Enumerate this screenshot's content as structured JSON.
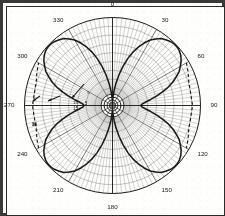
{
  "figure": {
    "frame_color": "#3a3a38",
    "background_color": "#fefefc",
    "ink_color": "#1a1a1a",
    "grid_color": "#5a5a58"
  },
  "chart_data": {
    "type": "line",
    "projection": "polar",
    "title": "",
    "xlabel": "",
    "ylabel": "",
    "angle_unit": "degrees",
    "angle_direction": "clockwise",
    "angle_zero_location": "N",
    "grid": true,
    "legend_position": "none",
    "angular_tick_labels": [
      "0",
      "30",
      "60",
      "90",
      "120",
      "150",
      "180",
      "210",
      "240",
      "270",
      "300",
      "330"
    ],
    "angular_ticks": [
      0,
      30,
      60,
      90,
      120,
      150,
      180,
      210,
      240,
      270,
      300,
      330
    ],
    "angular_minor_tick_step": 3,
    "radial_tick_labels": [
      "30",
      "15",
      "5",
      "0"
    ],
    "radial_rings": 10,
    "rlim": [
      0,
      1
    ],
    "annotations": [
      {
        "text": "15",
        "angle": 272,
        "r": 0.42
      },
      {
        "text": "30",
        "angle": 255,
        "r": 0.92
      },
      {
        "text": "5",
        "angle": 295,
        "r": 0.3
      }
    ],
    "series": [
      {
        "name": "measured pattern",
        "style": "solid",
        "x": [
          0,
          3,
          6,
          9,
          12,
          15,
          18,
          21,
          24,
          27,
          30,
          33,
          36,
          39,
          42,
          45,
          48,
          51,
          54,
          57,
          60,
          63,
          66,
          69,
          72,
          75,
          78,
          81,
          84,
          87,
          90,
          93,
          96,
          99,
          102,
          105,
          108,
          111,
          114,
          117,
          120,
          123,
          126,
          129,
          132,
          135,
          138,
          141,
          144,
          147,
          150,
          153,
          156,
          159,
          162,
          165,
          168,
          171,
          174,
          177,
          180,
          183,
          186,
          189,
          192,
          195,
          198,
          201,
          204,
          207,
          210,
          213,
          216,
          219,
          222,
          225,
          228,
          231,
          234,
          237,
          240,
          243,
          246,
          249,
          252,
          255,
          258,
          261,
          264,
          267,
          270,
          273,
          276,
          279,
          282,
          285,
          288,
          291,
          294,
          297,
          300,
          303,
          306,
          309,
          312,
          315,
          318,
          321,
          324,
          327,
          330,
          333,
          336,
          339,
          342,
          345,
          348,
          351,
          354,
          357
        ],
        "y": [
          0.04,
          0.09,
          0.17,
          0.26,
          0.36,
          0.46,
          0.56,
          0.65,
          0.73,
          0.8,
          0.86,
          0.9,
          0.94,
          0.96,
          0.98,
          0.99,
          0.99,
          0.98,
          0.96,
          0.93,
          0.89,
          0.85,
          0.79,
          0.73,
          0.66,
          0.58,
          0.51,
          0.44,
          0.38,
          0.34,
          0.32,
          0.34,
          0.38,
          0.44,
          0.51,
          0.58,
          0.66,
          0.73,
          0.79,
          0.85,
          0.89,
          0.93,
          0.96,
          0.98,
          0.99,
          0.99,
          0.98,
          0.96,
          0.94,
          0.9,
          0.86,
          0.8,
          0.73,
          0.65,
          0.56,
          0.46,
          0.36,
          0.26,
          0.17,
          0.09,
          0.04,
          0.09,
          0.17,
          0.26,
          0.36,
          0.46,
          0.56,
          0.65,
          0.73,
          0.8,
          0.86,
          0.9,
          0.94,
          0.96,
          0.98,
          0.99,
          0.99,
          0.98,
          0.96,
          0.93,
          0.89,
          0.85,
          0.79,
          0.73,
          0.66,
          0.58,
          0.51,
          0.44,
          0.38,
          0.34,
          0.32,
          0.34,
          0.38,
          0.44,
          0.51,
          0.58,
          0.66,
          0.73,
          0.79,
          0.85,
          0.89,
          0.93,
          0.96,
          0.98,
          0.99,
          0.99,
          0.98,
          0.96,
          0.94,
          0.9,
          0.86,
          0.8,
          0.73,
          0.65,
          0.56,
          0.46,
          0.36,
          0.26,
          0.17,
          0.09
        ]
      },
      {
        "name": "reference pattern",
        "style": "dashed",
        "x": [
          60,
          66,
          72,
          78,
          84,
          90,
          96,
          102,
          108,
          114,
          120,
          240,
          246,
          252,
          258,
          264,
          270,
          276,
          282,
          288,
          294,
          300
        ],
        "y": [
          0.97,
          0.94,
          0.91,
          0.9,
          0.9,
          0.91,
          0.9,
          0.9,
          0.91,
          0.94,
          0.97,
          0.97,
          0.94,
          0.91,
          0.9,
          0.9,
          0.91,
          0.9,
          0.9,
          0.91,
          0.94,
          0.97
        ]
      }
    ]
  }
}
